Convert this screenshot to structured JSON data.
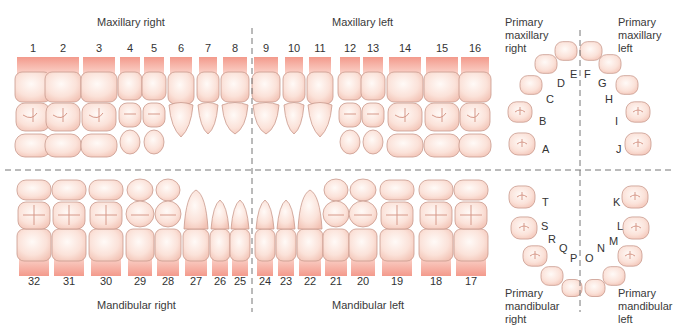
{
  "quadrants": {
    "maxillary_right": "Maxillary right",
    "maxillary_left": "Maxillary left",
    "mandibular_right": "Mandibular right",
    "mandibular_left": "Mandibular left"
  },
  "primary_labels": {
    "maxillary_right": [
      "Primary",
      "maxillary",
      "right"
    ],
    "maxillary_left": [
      "Primary",
      "maxillary",
      "left"
    ],
    "mandibular_right": [
      "Primary",
      "mandibular",
      "right"
    ],
    "mandibular_left": [
      "Primary",
      "mandibular",
      "left"
    ]
  },
  "upper_teeth": [
    {
      "num": "1",
      "x": 33,
      "w": 36,
      "type": "molar"
    },
    {
      "num": "2",
      "x": 63,
      "w": 36,
      "type": "molar"
    },
    {
      "num": "3",
      "x": 99,
      "w": 36,
      "type": "molar"
    },
    {
      "num": "4",
      "x": 130,
      "w": 24,
      "type": "premolar"
    },
    {
      "num": "5",
      "x": 154,
      "w": 24,
      "type": "premolar"
    },
    {
      "num": "6",
      "x": 181,
      "w": 26,
      "type": "canine"
    },
    {
      "num": "7",
      "x": 208,
      "w": 22,
      "type": "incisor"
    },
    {
      "num": "8",
      "x": 235,
      "w": 28,
      "type": "incisor"
    },
    {
      "num": "9",
      "x": 266,
      "w": 28,
      "type": "incisor"
    },
    {
      "num": "10",
      "x": 294,
      "w": 22,
      "type": "incisor"
    },
    {
      "num": "11",
      "x": 320,
      "w": 26,
      "type": "canine"
    },
    {
      "num": "12",
      "x": 350,
      "w": 24,
      "type": "premolar"
    },
    {
      "num": "13",
      "x": 373,
      "w": 24,
      "type": "premolar"
    },
    {
      "num": "14",
      "x": 405,
      "w": 36,
      "type": "molar"
    },
    {
      "num": "15",
      "x": 442,
      "w": 36,
      "type": "molar"
    },
    {
      "num": "16",
      "x": 475,
      "w": 32,
      "type": "molar"
    }
  ],
  "lower_teeth": [
    {
      "num": "32",
      "x": 34,
      "w": 34,
      "type": "molar"
    },
    {
      "num": "31",
      "x": 69,
      "w": 34,
      "type": "molar"
    },
    {
      "num": "30",
      "x": 106,
      "w": 34,
      "type": "molar"
    },
    {
      "num": "29",
      "x": 140,
      "w": 28,
      "type": "premolar"
    },
    {
      "num": "28",
      "x": 168,
      "w": 26,
      "type": "premolar"
    },
    {
      "num": "27",
      "x": 196,
      "w": 26,
      "type": "canine"
    },
    {
      "num": "26",
      "x": 220,
      "w": 20,
      "type": "incisor"
    },
    {
      "num": "25",
      "x": 240,
      "w": 20,
      "type": "incisor"
    },
    {
      "num": "24",
      "x": 265,
      "w": 20,
      "type": "incisor"
    },
    {
      "num": "23",
      "x": 286,
      "w": 20,
      "type": "incisor"
    },
    {
      "num": "22",
      "x": 310,
      "w": 26,
      "type": "canine"
    },
    {
      "num": "21",
      "x": 336,
      "w": 26,
      "type": "premolar"
    },
    {
      "num": "20",
      "x": 363,
      "w": 28,
      "type": "premolar"
    },
    {
      "num": "19",
      "x": 397,
      "w": 34,
      "type": "molar"
    },
    {
      "num": "18",
      "x": 436,
      "w": 34,
      "type": "molar"
    },
    {
      "num": "17",
      "x": 471,
      "w": 34,
      "type": "molar"
    }
  ],
  "primary_upper": [
    {
      "letter": "A",
      "tx": 542,
      "ty": 150,
      "cx": 522,
      "cy": 144,
      "r": 13
    },
    {
      "letter": "B",
      "tx": 539,
      "ty": 122,
      "cx": 520,
      "cy": 112,
      "r": 12
    },
    {
      "letter": "C",
      "tx": 546,
      "ty": 100,
      "cx": 531,
      "cy": 85,
      "r": 11
    },
    {
      "letter": "D",
      "tx": 557,
      "ty": 84,
      "cx": 546,
      "cy": 64,
      "r": 11
    },
    {
      "letter": "E",
      "tx": 570,
      "ty": 75,
      "cx": 566,
      "cy": 51,
      "r": 11
    },
    {
      "letter": "F",
      "tx": 584,
      "ty": 75,
      "cx": 591,
      "cy": 51,
      "r": 11
    },
    {
      "letter": "G",
      "tx": 598,
      "ty": 84,
      "cx": 610,
      "cy": 64,
      "r": 11
    },
    {
      "letter": "H",
      "tx": 605,
      "ty": 100,
      "cx": 627,
      "cy": 85,
      "r": 11
    },
    {
      "letter": "I",
      "tx": 615,
      "ty": 122,
      "cx": 638,
      "cy": 112,
      "r": 12
    },
    {
      "letter": "J",
      "tx": 616,
      "ty": 150,
      "cx": 638,
      "cy": 144,
      "r": 13
    }
  ],
  "primary_lower": [
    {
      "letter": "K",
      "tx": 613,
      "ty": 203,
      "cx": 635,
      "cy": 197,
      "r": 13
    },
    {
      "letter": "L",
      "tx": 617,
      "ty": 227,
      "cx": 636,
      "cy": 228,
      "r": 13
    },
    {
      "letter": "M",
      "tx": 609,
      "ty": 242,
      "cx": 630,
      "cy": 256,
      "r": 12
    },
    {
      "letter": "N",
      "tx": 597,
      "ty": 249,
      "cx": 614,
      "cy": 276,
      "r": 11
    },
    {
      "letter": "O",
      "tx": 585,
      "ty": 259,
      "cx": 595,
      "cy": 288,
      "r": 10
    },
    {
      "letter": "P",
      "tx": 570,
      "ty": 259,
      "cx": 572,
      "cy": 288,
      "r": 10
    },
    {
      "letter": "Q",
      "tx": 559,
      "ty": 249,
      "cx": 552,
      "cy": 276,
      "r": 11
    },
    {
      "letter": "R",
      "tx": 548,
      "ty": 240,
      "cx": 535,
      "cy": 256,
      "r": 12
    },
    {
      "letter": "S",
      "tx": 541,
      "ty": 227,
      "cx": 524,
      "cy": 228,
      "r": 13
    },
    {
      "letter": "T",
      "tx": 542,
      "ty": 203,
      "cx": 522,
      "cy": 197,
      "r": 13
    }
  ],
  "colors": {
    "tooth_fill": "#fbe3dc",
    "tooth_stroke": "#c99a8e",
    "gum": "#f39a8c",
    "groove": "#d6998a",
    "divider": "#777777"
  }
}
